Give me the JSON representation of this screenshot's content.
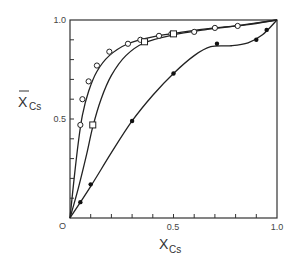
{
  "chart_data": {
    "type": "scatter",
    "title": "",
    "xlabel": "X_Cs",
    "ylabel": "X̄_Cs",
    "xlabel_main": "X",
    "xlabel_sub": "Cs",
    "ylabel_main": "X",
    "ylabel_sub": "Cs",
    "xlim": [
      0,
      1.0
    ],
    "ylim": [
      0,
      1.0
    ],
    "x_tick_labels": [
      "0",
      "0.5",
      "1.0"
    ],
    "y_tick_labels": [
      "0.5",
      "1.0"
    ],
    "origin_label": "O",
    "grid": false,
    "legend": "none",
    "series": [
      {
        "name": "open circles",
        "marker": "open-circle",
        "points": [
          [
            0.05,
            0.47
          ],
          [
            0.06,
            0.6
          ],
          [
            0.09,
            0.69
          ],
          [
            0.13,
            0.77
          ],
          [
            0.19,
            0.84
          ],
          [
            0.28,
            0.88
          ],
          [
            0.34,
            0.9
          ],
          [
            0.43,
            0.92
          ],
          [
            0.49,
            0.93
          ],
          [
            0.6,
            0.94
          ],
          [
            0.7,
            0.96
          ],
          [
            0.81,
            0.97
          ]
        ],
        "curve": [
          [
            0,
            0
          ],
          [
            0.02,
            0.2
          ],
          [
            0.04,
            0.38
          ],
          [
            0.06,
            0.52
          ],
          [
            0.09,
            0.64
          ],
          [
            0.13,
            0.74
          ],
          [
            0.19,
            0.82
          ],
          [
            0.28,
            0.88
          ],
          [
            0.4,
            0.915
          ],
          [
            0.55,
            0.94
          ],
          [
            0.7,
            0.96
          ],
          [
            0.85,
            0.975
          ],
          [
            1.0,
            1.0
          ]
        ]
      },
      {
        "name": "open squares",
        "marker": "open-square",
        "points": [
          [
            0.11,
            0.47
          ],
          [
            0.36,
            0.89
          ],
          [
            0.5,
            0.93
          ]
        ],
        "curve": [
          [
            0,
            0
          ],
          [
            0.04,
            0.15
          ],
          [
            0.08,
            0.32
          ],
          [
            0.11,
            0.46
          ],
          [
            0.15,
            0.6
          ],
          [
            0.2,
            0.72
          ],
          [
            0.27,
            0.82
          ],
          [
            0.36,
            0.885
          ],
          [
            0.5,
            0.925
          ],
          [
            0.65,
            0.95
          ],
          [
            0.8,
            0.97
          ],
          [
            1.0,
            1.0
          ]
        ]
      },
      {
        "name": "filled circles",
        "marker": "filled-circle",
        "points": [
          [
            0.05,
            0.08
          ],
          [
            0.1,
            0.17
          ],
          [
            0.3,
            0.49
          ],
          [
            0.5,
            0.73
          ],
          [
            0.71,
            0.88
          ],
          [
            0.9,
            0.9
          ],
          [
            0.95,
            0.95
          ]
        ],
        "curve": [
          [
            0,
            0
          ],
          [
            0.1,
            0.16
          ],
          [
            0.2,
            0.33
          ],
          [
            0.3,
            0.49
          ],
          [
            0.4,
            0.62
          ],
          [
            0.5,
            0.73
          ],
          [
            0.6,
            0.82
          ],
          [
            0.68,
            0.865
          ],
          [
            0.78,
            0.87
          ],
          [
            0.86,
            0.885
          ],
          [
            0.93,
            0.925
          ],
          [
            1.0,
            1.0
          ]
        ]
      }
    ]
  }
}
